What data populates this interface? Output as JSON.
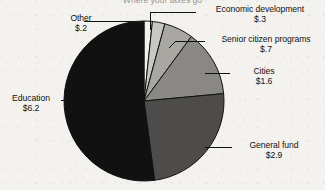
{
  "chart_data": {
    "type": "pie",
    "title": "Where your taxes go",
    "title_clipped": true,
    "units": "billions of dollars",
    "total": 11.9,
    "start_angle_deg": 0,
    "direction": "clockwise",
    "legend": "none",
    "grid": false,
    "categories": [
      "Other",
      "Economic development",
      "Senior citizen programs",
      "Cities",
      "General fund",
      "Education"
    ],
    "values": [
      0.2,
      0.3,
      0.7,
      1.6,
      2.9,
      6.2
    ],
    "value_labels": [
      "$.2",
      "$.3",
      "$.7",
      "$1.6",
      "$2.9",
      "$6.2"
    ],
    "colors": [
      "#f3f1ec",
      "#c9c7c2",
      "#a9a7a2",
      "#8a8884",
      "#4e4c4a",
      "#111111"
    ],
    "slices": [
      {
        "name": "Other",
        "value_label": "$.2",
        "value": 0.2,
        "color": "#f3f1ec",
        "start": 0,
        "end": 6.05
      },
      {
        "name": "Economic development",
        "value_label": "$.3",
        "value": 0.3,
        "color": "#c9c7c2",
        "start": 6.05,
        "end": 15.13
      },
      {
        "name": "Senior citizen programs",
        "value_label": "$.7",
        "value": 0.7,
        "color": "#a9a7a2",
        "start": 15.13,
        "end": 36.3
      },
      {
        "name": "Cities",
        "value_label": "$1.6",
        "value": 1.6,
        "color": "#8a8884",
        "start": 36.3,
        "end": 84.7
      },
      {
        "name": "General fund",
        "value_label": "$2.9",
        "value": 2.9,
        "color": "#4e4c4a",
        "start": 84.7,
        "end": 172.4
      },
      {
        "name": "Education",
        "value_label": "$6.2",
        "value": 6.2,
        "color": "#111111",
        "start": 172.4,
        "end": 360
      }
    ]
  },
  "labels": {
    "other": {
      "name": "Other",
      "value": "$.2"
    },
    "economic": {
      "name": "Economic development",
      "value": "$.3"
    },
    "senior": {
      "name": "Senior citizen programs",
      "value": "$.7"
    },
    "cities": {
      "name": "Cities",
      "value": "$1.6"
    },
    "general": {
      "name": "General fund",
      "value": "$2.9"
    },
    "education": {
      "name": "Education",
      "value": "$6.2"
    }
  }
}
